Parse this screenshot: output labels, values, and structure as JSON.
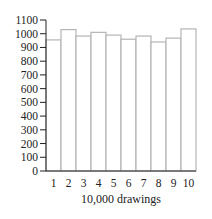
{
  "chart_data": {
    "type": "bar",
    "title": "",
    "xlabel": "10,000 drawings",
    "ylabel": "",
    "categories": [
      "1",
      "2",
      "3",
      "4",
      "5",
      "6",
      "7",
      "8",
      "9",
      "10"
    ],
    "values": [
      955,
      1030,
      983,
      1010,
      990,
      960,
      983,
      940,
      968,
      1035
    ],
    "ylim": [
      0,
      1100
    ],
    "yticks": [
      0,
      100,
      200,
      300,
      400,
      500,
      600,
      700,
      800,
      900,
      1000,
      1100
    ],
    "grid": false,
    "legend": null,
    "colors": {
      "bar_fill": "#ffffff",
      "bar_stroke": "#b5b5b5",
      "axis": "#222222"
    }
  }
}
